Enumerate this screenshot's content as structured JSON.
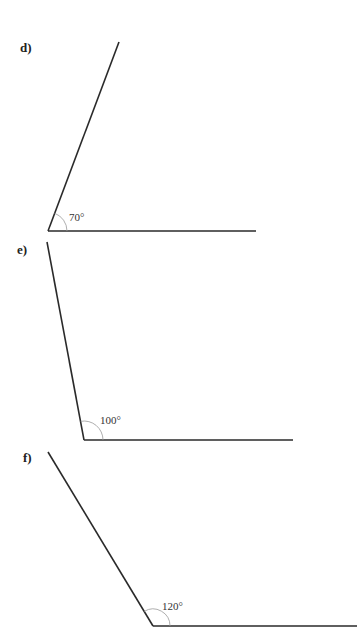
{
  "problems": [
    {
      "label": "d)",
      "angle_label": "70°",
      "angle_degrees": 70
    },
    {
      "label": "e)",
      "angle_label": "100°",
      "angle_degrees": 100
    },
    {
      "label": "f)",
      "angle_label": "120°",
      "angle_degrees": 120
    }
  ]
}
